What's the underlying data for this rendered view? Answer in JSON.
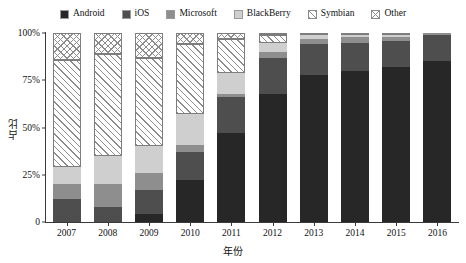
{
  "chart_data": {
    "type": "bar",
    "stacked": true,
    "normalized": true,
    "title": "",
    "xlabel": "年份",
    "ylabel": "占比",
    "ylim": [
      0,
      100
    ],
    "yticks": [
      "0",
      "25%",
      "50%",
      "75%",
      "100%"
    ],
    "ytick_values": [
      0,
      25,
      50,
      75,
      100
    ],
    "grid": false,
    "legend_position": "top",
    "categories": [
      "2007",
      "2008",
      "2009",
      "2010",
      "2011",
      "2012",
      "2013",
      "2014",
      "2015",
      "2016"
    ],
    "series": [
      {
        "name": "Android",
        "color": "#272727",
        "pattern": "solid",
        "values": [
          0,
          0,
          4,
          22,
          47,
          68,
          78,
          80,
          82,
          85
        ]
      },
      {
        "name": "iOS",
        "color": "#4e4e4e",
        "pattern": "solid",
        "values": [
          12,
          8,
          13,
          15,
          19,
          19,
          16,
          15,
          14,
          14
        ]
      },
      {
        "name": "Microsoft",
        "color": "#8e8e8e",
        "pattern": "solid",
        "values": [
          8,
          12,
          9,
          4,
          2,
          3,
          3,
          3,
          2,
          1
        ]
      },
      {
        "name": "BlackBerry",
        "color": "#cfcfcf",
        "pattern": "solid",
        "values": [
          9,
          15,
          14,
          16,
          11,
          5,
          2,
          1,
          1,
          0
        ]
      },
      {
        "name": "Symbian",
        "color": "#8d8d8d",
        "pattern": "diagonal",
        "values": [
          57,
          54,
          47,
          37,
          18,
          4,
          0,
          0,
          0,
          0
        ]
      },
      {
        "name": "Other",
        "color": "#8d8d8d",
        "pattern": "crosshatch",
        "values": [
          14,
          11,
          13,
          6,
          3,
          1,
          1,
          1,
          1,
          0
        ]
      }
    ]
  },
  "legend": {
    "items": [
      {
        "label": "Android",
        "swatch": "android-swatch"
      },
      {
        "label": "iOS",
        "swatch": "ios-swatch"
      },
      {
        "label": "Microsoft",
        "swatch": "microsoft-swatch"
      },
      {
        "label": "BlackBerry",
        "swatch": "blackberry-swatch"
      },
      {
        "label": "Symbian",
        "swatch": "symbian-swatch"
      },
      {
        "label": "Other",
        "swatch": "other-swatch"
      }
    ]
  }
}
